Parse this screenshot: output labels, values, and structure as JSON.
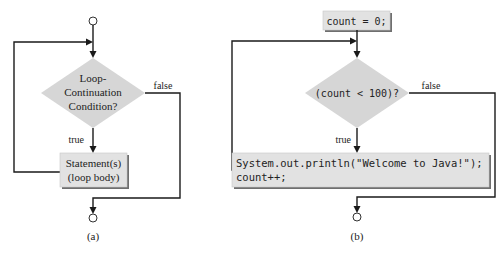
{
  "colors": {
    "shape_fill": "#d6d6d6",
    "box_fill": "#e2e2e2",
    "shadow": "#6f6f6f",
    "line": "#1a1a1a",
    "background": "#ffffff"
  },
  "diagram_a": {
    "caption": "(a)",
    "condition_lines": [
      "Loop-",
      "Continuation",
      "Condition?"
    ],
    "true_label": "true",
    "false_label": "false",
    "body_lines": [
      "Statement(s)",
      "(loop body)"
    ]
  },
  "diagram_b": {
    "caption": "(b)",
    "init": "count = 0;",
    "condition": "(count < 100)?",
    "true_label": "true",
    "false_label": "false",
    "body_lines": [
      "System.out.println(\"Welcome to Java!\");",
      "count++;"
    ]
  }
}
